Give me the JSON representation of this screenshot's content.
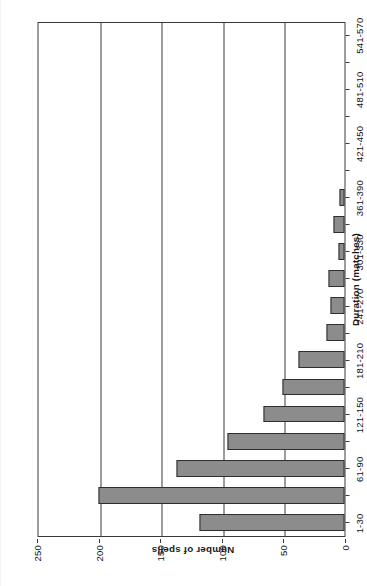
{
  "chart_data": {
    "type": "bar",
    "orientation": "horizontal",
    "title": "",
    "xlabel": "Duration (matches)",
    "ylabel": "Number of spells",
    "categories": [
      "1-30",
      "31-60",
      "61-90",
      "91-120",
      "121-150",
      "151-180",
      "181-210",
      "211-240",
      "241-270",
      "271-300",
      "301-330",
      "331-360",
      "361-390",
      "391-420",
      "421-450",
      "451-480",
      "481-510",
      "511-540",
      "541-570"
    ],
    "category_tick_labels_shown": [
      "1-30",
      "61-90",
      "121-150",
      "181-210",
      "241-270",
      "301-330",
      "361-390",
      "421-450",
      "481-510",
      "541-570"
    ],
    "values": [
      118,
      200,
      136,
      95,
      66,
      50,
      37,
      15,
      11,
      13,
      5,
      9,
      4,
      0,
      0,
      0,
      0,
      0,
      0
    ],
    "value_axis_ticks": [
      0,
      50,
      100,
      150,
      200,
      250
    ],
    "ylim": [
      0,
      250
    ],
    "grid": "value-axis gridlines only",
    "legend": "none",
    "bar_fill_color": "#8c8c8c",
    "bar_border_color": "#2e2e2e",
    "axis_color": "#3a3a3a"
  },
  "axes": {
    "value_axis_title": "Number of spells",
    "category_axis_title": "Duration (matches)"
  }
}
